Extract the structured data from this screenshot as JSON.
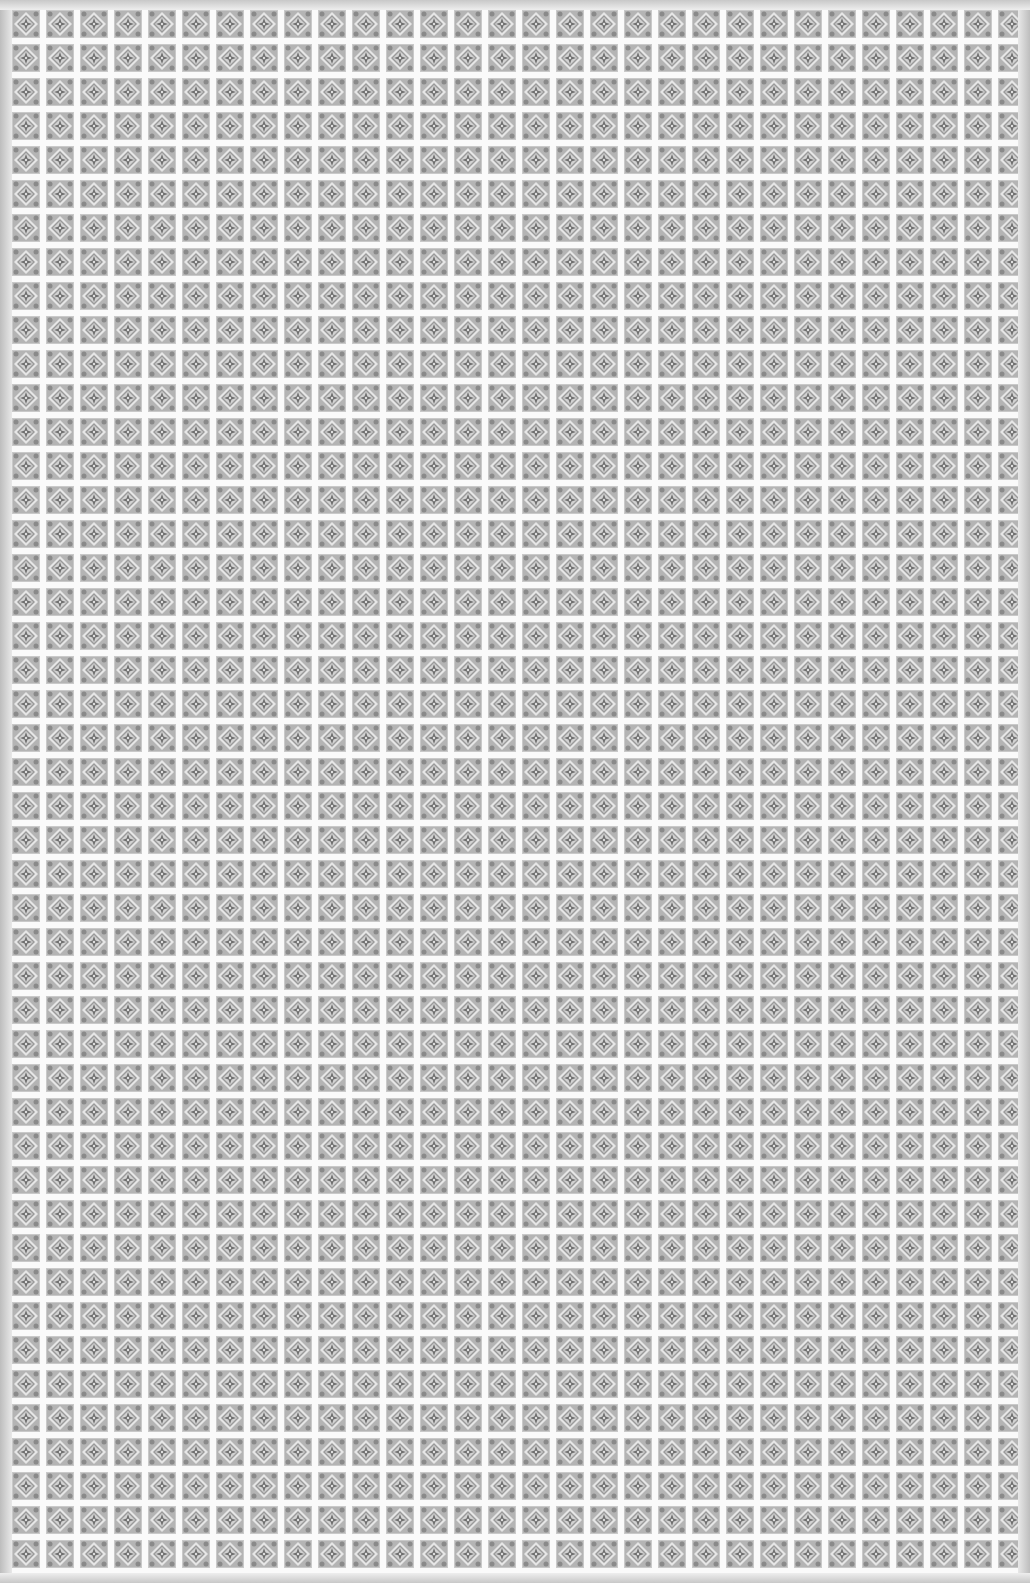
{
  "image": {
    "description": "Grayscale seamless ornamental tile pattern",
    "tile_size_px": 34,
    "colors": {
      "background": "#f4f4f4",
      "motif_dark": "#7a7a7a",
      "motif_mid": "#a8a8a8",
      "grout": "#fafafa"
    },
    "motif": "diamond-with-fleur-cross"
  }
}
